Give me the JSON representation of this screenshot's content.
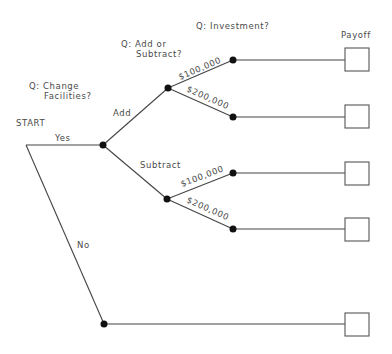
{
  "diagram": {
    "type": "decision-tree",
    "start_label": "START",
    "questions": {
      "q1_line1": "Q: Change",
      "q1_line2": "Facilities?",
      "q2_line1": "Q: Add or",
      "q2_line2": "Subtract?",
      "q3": "Q: Investment?"
    },
    "payoff_header": "Payoff",
    "edges": {
      "yes": "Yes",
      "no": "No",
      "add": "Add",
      "subtract": "Subtract",
      "add_100k": "$100,000",
      "add_200k": "$200,000",
      "sub_100k": "$100,000",
      "sub_200k": "$200,000"
    },
    "payoffs": [
      {
        "path": "Yes / Add / $100,000",
        "value": ""
      },
      {
        "path": "Yes / Add / $200,000",
        "value": ""
      },
      {
        "path": "Yes / Subtract / $100,000",
        "value": ""
      },
      {
        "path": "Yes / Subtract / $200,000",
        "value": ""
      },
      {
        "path": "No",
        "value": ""
      }
    ]
  }
}
